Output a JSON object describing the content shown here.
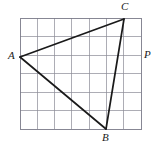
{
  "figure": {
    "kind": "triangle-on-grid",
    "colors": {
      "background": "#ffffff",
      "grid_line": "#8a8a96",
      "grid_border": "#7a7a88",
      "triangle_stroke": "#1a1a1a",
      "label_text": "#1a1a1a"
    },
    "grid": {
      "columns": 7,
      "rows": 6,
      "x_start": 20,
      "y_start": 18,
      "cell_width": 17.3,
      "cell_height": 18.5
    },
    "vertices": [
      {
        "name": "A",
        "label": "A",
        "x": 20,
        "y": 57,
        "label_x": 8,
        "label_y": 50
      },
      {
        "name": "B",
        "label": "B",
        "x": 106,
        "y": 129,
        "label_x": 102,
        "label_y": 132
      },
      {
        "name": "C",
        "label": "C",
        "x": 124,
        "y": 19,
        "label_x": 121,
        "label_y": 1
      }
    ],
    "annotations": [
      {
        "name": "P",
        "label": "P",
        "label_x": 144,
        "label_y": 49
      }
    ],
    "edges": [
      {
        "name": "edge-AC",
        "from": "A",
        "to": "C"
      },
      {
        "name": "edge-CB",
        "from": "C",
        "to": "B"
      },
      {
        "name": "edge-BA",
        "from": "B",
        "to": "A"
      }
    ]
  }
}
